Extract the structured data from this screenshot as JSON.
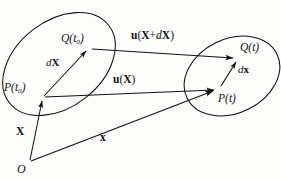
{
  "figure": {
    "type": "continuum-mechanics-deformation-diagram",
    "background_color": "#fdfdfc",
    "stroke_color": "#111111"
  },
  "regions": [
    {
      "id": "reference-configuration",
      "name": "left-blob-reference-configuration",
      "cx": 59,
      "cy": 64,
      "rx": 63,
      "ry": 43,
      "rotation": -38
    },
    {
      "id": "current-configuration",
      "name": "right-blob-current-configuration",
      "cx": 232,
      "cy": 76,
      "rx": 50,
      "ry": 37,
      "rotation": -26
    }
  ],
  "points": [
    {
      "id": "Q0",
      "label_html": "Q(t<sub>0</sub>)",
      "label_text": "Q(t0)",
      "x": 88,
      "y": 48,
      "label_x": 61,
      "label_y": 33
    },
    {
      "id": "P0",
      "label_html": "P(t<sub>0</sub>)",
      "label_text": "P(t0)",
      "x": 42,
      "y": 97,
      "label_x": 5,
      "label_y": 82
    },
    {
      "id": "Qt",
      "label_html": "Q(t)",
      "label_text": "Q(t)",
      "x": 236,
      "y": 57,
      "label_x": 240,
      "label_y": 42
    },
    {
      "id": "Pt",
      "label_html": "P(t)",
      "label_text": "P(t)",
      "x": 217,
      "y": 89,
      "label_x": 219,
      "label_y": 93
    },
    {
      "id": "O",
      "label_html": "O",
      "label_text": "O",
      "x": 30,
      "y": 161,
      "label_x": 18,
      "label_y": 164
    }
  ],
  "vectors": [
    {
      "id": "u-X-plus-dX",
      "name": "displacement-vector-at-Q",
      "label_text": "u(X + dX)",
      "from": [
        92,
        49
      ],
      "to": [
        234,
        58
      ],
      "label_x": 133,
      "label_y": 31
    },
    {
      "id": "u-X",
      "name": "displacement-vector-at-P",
      "label_text": "u(X)",
      "from": [
        45,
        97
      ],
      "to": [
        215,
        90
      ],
      "label_x": 113,
      "label_y": 75
    },
    {
      "id": "dX",
      "name": "material-line-element-reference",
      "label_text": "dX",
      "from": [
        44,
        96
      ],
      "to": [
        86,
        50
      ],
      "label_x": 47,
      "label_y": 58
    },
    {
      "id": "dx",
      "name": "material-line-element-current",
      "label_text": "dx",
      "from": [
        222,
        86
      ],
      "to": [
        238,
        60
      ],
      "label_x": 238,
      "label_y": 64
    },
    {
      "id": "X",
      "name": "reference-position-vector",
      "label_text": "X",
      "from": [
        30,
        160
      ],
      "to": [
        42,
        99
      ],
      "label_x": 17,
      "label_y": 127
    },
    {
      "id": "x",
      "name": "current-position-vector",
      "label_text": "x",
      "from": [
        31,
        161
      ],
      "to": [
        214,
        91
      ],
      "label_x": 100,
      "label_y": 131
    }
  ],
  "labels": {
    "u_x_plus_dx": {
      "bold_u": "u",
      "open": "(",
      "bold_X": "X",
      "plus": "+",
      "italic_d": "d",
      "bold_X2": "X",
      "close": ")"
    },
    "u_x": {
      "bold_u": "u",
      "open": "(",
      "bold_X": "X",
      "close": ")"
    },
    "dX": {
      "italic_d": "d",
      "bold_X": "X"
    },
    "dx": {
      "italic_d": "d",
      "bold_x": "x"
    },
    "X_vec": {
      "bold_X": "X"
    },
    "x_vec": {
      "bold_x": "x"
    },
    "origin": {
      "text": "O"
    },
    "Q0": {
      "letter": "Q",
      "open": "(",
      "var": "t",
      "sub": "0",
      "close": ")"
    },
    "P0": {
      "letter": "P",
      "open": "(",
      "var": "t",
      "sub": "0",
      "close": ")"
    },
    "Qt": {
      "letter": "Q",
      "open": "(",
      "var": "t",
      "close": ")"
    },
    "Pt": {
      "letter": "P",
      "open": "(",
      "var": "t",
      "close": ")"
    }
  }
}
